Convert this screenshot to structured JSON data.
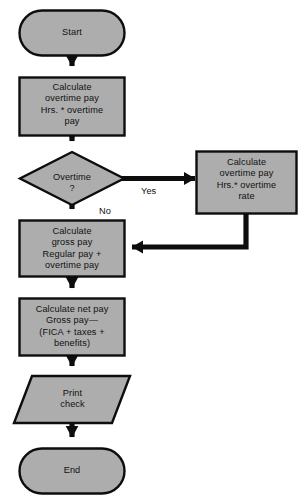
{
  "diagram": {
    "type": "flowchart",
    "colors": {
      "shape_fill": "#adadad",
      "shape_stroke": "#0d0d0d",
      "connector": "#0d0d0d",
      "text": "#111111",
      "background": "#ffffff"
    },
    "nodes": {
      "start": {
        "shape": "terminator",
        "label": "Start"
      },
      "calc_overtime_pay": {
        "shape": "process",
        "label": "Calculate\novertime pay\nHrs.  *  overtime\npay"
      },
      "overtime_decision": {
        "shape": "decision",
        "label": "Overtime\n?"
      },
      "calc_overtime_rate": {
        "shape": "process",
        "label": "Calculate\novertime pay\nHrs.* overtime\nrate"
      },
      "calc_gross_pay": {
        "shape": "process",
        "label": "Calculate\ngross pay\nRegular pay  +\novertime pay"
      },
      "calc_net_pay": {
        "shape": "process",
        "label": "Calculate net pay\nGross pay—\n(FICA  +  taxes  +\nbenefits)"
      },
      "print_check": {
        "shape": "input-output",
        "label": "Print\ncheck"
      },
      "end": {
        "shape": "terminator",
        "label": "End"
      }
    },
    "branch_labels": {
      "yes": "Yes",
      "no": "No"
    }
  }
}
